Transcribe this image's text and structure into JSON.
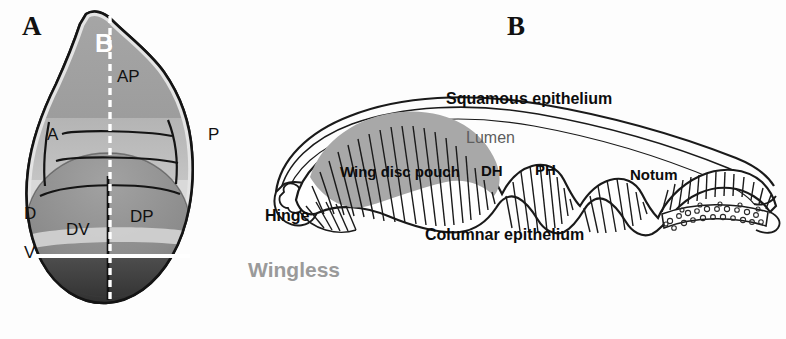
{
  "figure": {
    "background_color": "#fdfdfd"
  },
  "panel_a": {
    "letter": "A",
    "description": "Flat view of wing imaginal disc with compartment boundaries",
    "labels": {
      "section_plane": "B",
      "ap_axis": "AP",
      "anterior": "A",
      "posterior": "P",
      "dorsal": "D",
      "ventral": "V",
      "dorsal_ventral_left": "DV",
      "dorsal_posterior_right": "DP"
    },
    "colors": {
      "outline": "#1a1a1a",
      "notum_fill": "#9b9b9b",
      "hinge_fill": "#b9b9b9",
      "pouch_dorsal_fill": "#8a8a8a",
      "pouch_ventral_fill": "#4a4a4a",
      "dv_stripe": "#d5d5d5",
      "section_line": "#ffffff"
    }
  },
  "panel_b": {
    "letter": "B",
    "description": "Cross-section of wing disc showing squamous and columnar epithelia",
    "labels": {
      "squamous": "Squamous epithelium",
      "lumen": "Lumen",
      "columnar": "Columnar epithelium",
      "hinge": "Hinge",
      "pouch": "Wing disc pouch",
      "distal_hinge": "DH",
      "proximal_hinge": "PH",
      "notum": "Notum",
      "wingless": "Wingless"
    },
    "colors": {
      "outline": "#1a1a1a",
      "shaded_cells": "#a8a8a8",
      "wingless_text": "#9a9a9a",
      "lumen_text": "#5d5d5d",
      "label_text": "#0c0c0c"
    }
  }
}
